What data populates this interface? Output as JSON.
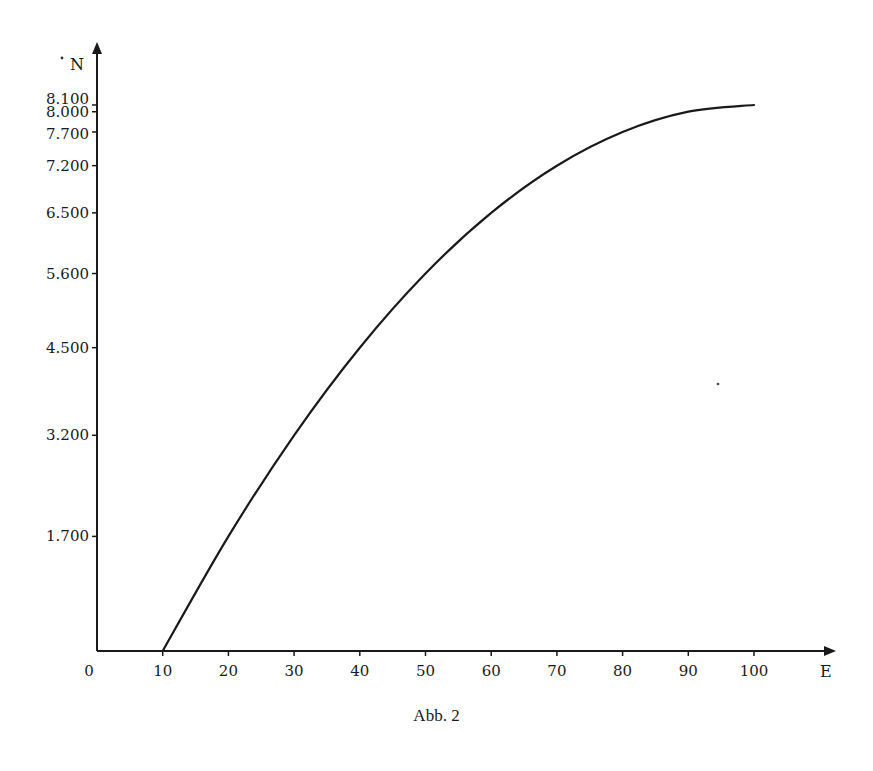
{
  "figure": {
    "caption": "Abb. 2",
    "colors": {
      "ink": "#1a1a1a",
      "background": "#ffffff"
    }
  },
  "chart_data": {
    "type": "line",
    "title": "",
    "caption": "Abb. 2",
    "xlabel": "E",
    "ylabel": "N",
    "x": [
      10,
      20,
      30,
      40,
      50,
      60,
      70,
      80,
      90,
      100
    ],
    "series": [
      {
        "name": "N(E)",
        "values": [
          0,
          1700,
          3200,
          4500,
          5600,
          6500,
          7200,
          7700,
          8000,
          8100
        ]
      }
    ],
    "xticks": [
      0,
      10,
      20,
      30,
      40,
      50,
      60,
      70,
      80,
      90,
      100
    ],
    "xtick_labels": [
      "0",
      "10",
      "20",
      "30",
      "40",
      "50",
      "60",
      "70",
      "80",
      "90",
      "100"
    ],
    "yticks": [
      1700,
      3200,
      4500,
      5600,
      6500,
      7200,
      7700,
      8000,
      8100
    ],
    "ytick_labels": [
      "1.700",
      "3.200",
      "4.500",
      "5.600",
      "6.500",
      "7.200",
      "7.700",
      "8.000",
      "8.100"
    ],
    "xlim": [
      0,
      110
    ],
    "ylim": [
      0,
      9000
    ],
    "grid": false,
    "legend": null
  }
}
